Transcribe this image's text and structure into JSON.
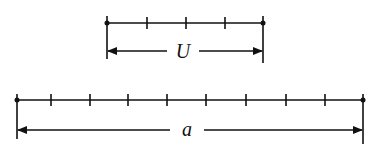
{
  "diagram": {
    "unit_segment": {
      "label": "U",
      "divisions": 4,
      "x_start": 107,
      "x_end": 263,
      "line_y": 23,
      "arrow_y": 51
    },
    "total_segment": {
      "label": "a",
      "divisions": 9,
      "x_start": 17,
      "x_end": 363,
      "line_y": 100,
      "arrow_y": 128
    },
    "stroke_color": "#111111"
  }
}
